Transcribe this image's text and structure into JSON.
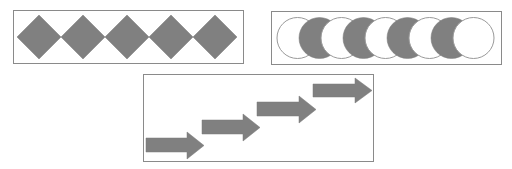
{
  "colors": {
    "background": "#ffffff",
    "frame_stroke": "#8a8a8a",
    "shape_fill": "#808080",
    "shape_stroke": "#7a7a7a",
    "white_fill": "#ffffff",
    "circle_outline": "#9a9a9a"
  },
  "panels": [
    {
      "name": "diamond-panel",
      "shape": "diamond",
      "count": 5,
      "fill": "gray"
    },
    {
      "name": "circle-panel",
      "shape": "circle",
      "count": 9,
      "pattern": [
        "white",
        "gray",
        "white",
        "gray",
        "white",
        "gray",
        "white",
        "gray",
        "white"
      ]
    },
    {
      "name": "arrow-panel",
      "shape": "arrow",
      "count": 4,
      "direction": "right",
      "arrangement": "ascending staircase"
    }
  ]
}
